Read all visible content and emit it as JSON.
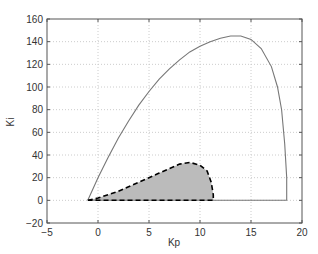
{
  "chart_data": {
    "type": "line",
    "title": "",
    "xlabel": "Kp",
    "ylabel": "Ki",
    "xlim": [
      -5,
      20
    ],
    "ylim": [
      -20,
      160
    ],
    "xticks": [
      -5,
      0,
      5,
      10,
      15,
      20
    ],
    "yticks": [
      -20,
      0,
      20,
      40,
      60,
      80,
      100,
      120,
      140,
      160
    ],
    "grid": true,
    "legend": null,
    "series": [
      {
        "name": "outer stability boundary",
        "style": "solid",
        "color": "#777777",
        "x": [
          -1.0,
          0,
          1,
          2,
          3,
          4,
          5,
          6,
          7,
          8,
          9,
          10,
          11,
          12,
          13,
          14,
          15,
          16,
          17,
          17.6,
          18.0,
          18.3,
          18.5,
          18.5,
          -1.0
        ],
        "y": [
          0,
          20,
          38,
          55,
          70,
          84,
          96,
          107,
          116,
          124,
          131,
          136,
          140,
          143,
          145,
          145,
          142,
          134,
          118,
          100,
          80,
          50,
          20,
          0,
          0
        ]
      },
      {
        "name": "inner region boundary (shaded)",
        "style": "dashed",
        "color": "#000000",
        "fill": "#bbbbbb",
        "x": [
          -1.0,
          0,
          1,
          2,
          3,
          4,
          5,
          6,
          7,
          8,
          9,
          10,
          10.7,
          11.1,
          11.3,
          11.3,
          -1.0
        ],
        "y": [
          0,
          2,
          5,
          8,
          12,
          16,
          20,
          24,
          28,
          32,
          33.5,
          31,
          26,
          16,
          5,
          0,
          0
        ]
      }
    ]
  }
}
